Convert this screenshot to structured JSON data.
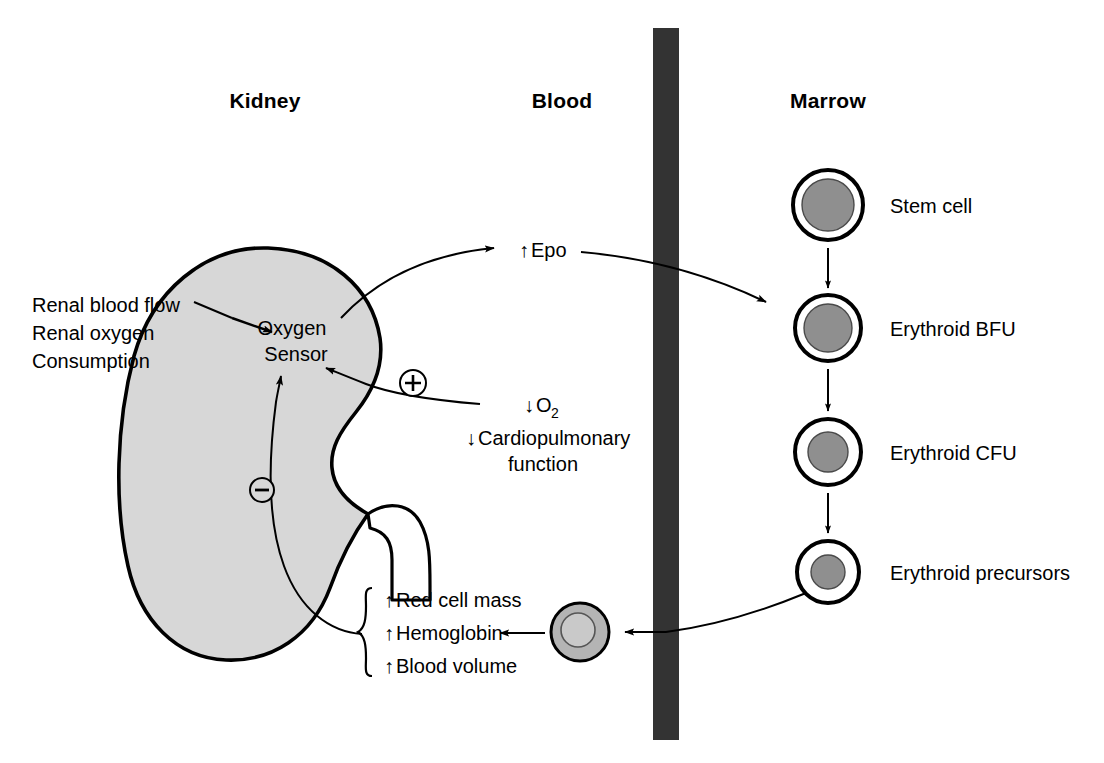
{
  "figure": {
    "type": "physiology-flow-diagram"
  },
  "columns": [
    {
      "id": "kidney",
      "label": "Kidney"
    },
    {
      "id": "blood",
      "label": "Blood"
    },
    {
      "id": "marrow",
      "label": "Marrow"
    }
  ],
  "kidney": {
    "organ_name": "kidney-shape",
    "sensor_label_line1": "Oxygen",
    "sensor_label_line2": "Sensor",
    "inputs": {
      "line1": "Renal blood flow",
      "line2": "Renal oxygen",
      "line3": "Consumption"
    },
    "positive_sign": "⊕",
    "negative_sign": "⊖",
    "fill_color": "#d7d7d7",
    "outline_color": "#000000"
  },
  "stimuli": {
    "o2_arrow": "↓",
    "o2_text": "O",
    "o2_subscript": "2",
    "cardio_arrow": "↓",
    "cardio_line1": "Cardiopulmonary",
    "cardio_line2": "function"
  },
  "epo": {
    "arrow": "↑",
    "label": "Epo"
  },
  "blood": {
    "vessel_color": "#333333",
    "erythrocyte_name": "erythrocyte",
    "erythrocyte_fill": "#b4b4b4",
    "erythrocyte_inner_fill": "#c9c9c9"
  },
  "outcomes": {
    "bracket": "curly-brace",
    "items": [
      {
        "arrow": "↑",
        "label": "Red cell mass"
      },
      {
        "arrow": "↑",
        "label": "Hemoglobin"
      },
      {
        "arrow": "↑",
        "label": "Blood volume"
      }
    ]
  },
  "marrow": {
    "cell_fill": "#8f8f8f",
    "cells": [
      {
        "id": "stem-cell",
        "label": "Stem cell",
        "cx": 828,
        "cy": 205,
        "r_outer": 35,
        "r_inner": 26
      },
      {
        "id": "erythroid-bfu",
        "label": "Erythroid BFU",
        "cx": 828,
        "cy": 328,
        "r_outer": 33,
        "r_inner": 24
      },
      {
        "id": "erythroid-cfu",
        "label": "Erythroid CFU",
        "cx": 828,
        "cy": 452,
        "r_outer": 33,
        "r_inner": 20
      },
      {
        "id": "erythroid-precursors",
        "label": "Erythroid precursors",
        "cx": 828,
        "cy": 572,
        "r_outer": 31,
        "r_inner": 17
      }
    ]
  }
}
